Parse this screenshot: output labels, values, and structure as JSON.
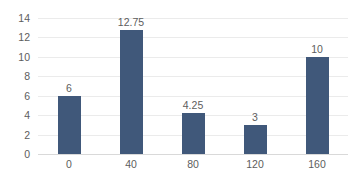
{
  "chart_data": {
    "type": "bar",
    "title": "",
    "subtitle": "",
    "xlabel": "",
    "ylabel": "",
    "categories": [
      "0",
      "40",
      "80",
      "120",
      "160"
    ],
    "values": [
      6,
      12.75,
      4.25,
      3,
      10
    ],
    "data_labels": [
      "6",
      "12.75",
      "4.25",
      "3",
      "10"
    ],
    "ylim": [
      0,
      14
    ],
    "ytick_values": [
      0,
      2,
      4,
      6,
      8,
      10,
      12,
      14
    ],
    "ytick_labels": [
      "0",
      "2",
      "4",
      "6",
      "8",
      "10",
      "12",
      "14"
    ],
    "grid": true,
    "grid_axis": "y",
    "legend": false,
    "legend_position": "none",
    "series": [
      {
        "name": "",
        "values": [
          6,
          12.75,
          4.25,
          3,
          10
        ],
        "color": "#40587A"
      }
    ],
    "colors": {
      "bar": "#40587A",
      "gridline": "#EBEBEB",
      "baseline": "#D9D9D9",
      "tick_text": "#5D5D5D",
      "label_text": "#5D5D5D",
      "background": "#FFFFFF"
    }
  }
}
